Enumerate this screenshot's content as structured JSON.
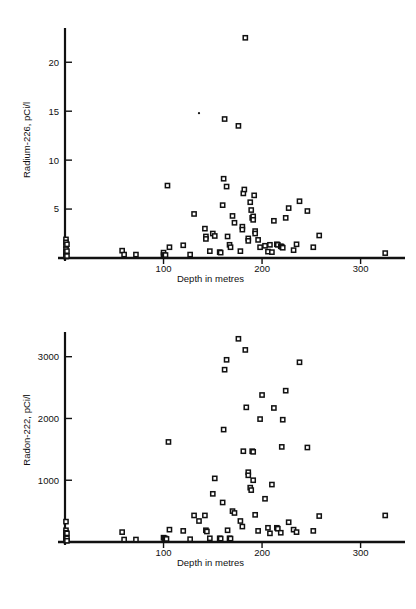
{
  "page": {
    "background_color": "#ffffff",
    "ink_color": "#111111",
    "marker_fill": "#ffffff"
  },
  "figures": [
    {
      "id": "radium-226-vs-depth",
      "ylabel": "Radium-226, pCi/l",
      "xlabel": "Depth in metres"
    },
    {
      "id": "radon-222-vs-depth",
      "ylabel": "Radon-222, pCi/l",
      "xlabel": "Depth in metres"
    }
  ],
  "chart_data": [
    {
      "type": "scatter",
      "title": "",
      "xlabel": "Depth in metres",
      "ylabel": "Radium-226, pCi/l",
      "xlim": [
        0,
        340
      ],
      "ylim": [
        0,
        23.5
      ],
      "xticks": [
        100,
        200,
        300
      ],
      "xticklabels": [
        "100",
        "200",
        "300"
      ],
      "yticks": [
        5,
        10,
        15,
        20
      ],
      "yticklabels": [
        "5",
        "10",
        "15",
        "20"
      ],
      "grid": false,
      "legend": null,
      "marker": "open-square",
      "points": [
        [
          1,
          1.9
        ],
        [
          1,
          1.6
        ],
        [
          1,
          1.3
        ],
        [
          1,
          0.9
        ],
        [
          1,
          0.6
        ],
        [
          1,
          0.3
        ],
        [
          1,
          0.15
        ],
        [
          2,
          1.4
        ],
        [
          2,
          0.7
        ],
        [
          2,
          0.2
        ],
        [
          58,
          0.75
        ],
        [
          60,
          0.35
        ],
        [
          72,
          0.35
        ],
        [
          100,
          0.55
        ],
        [
          100,
          0.3
        ],
        [
          101,
          0.25
        ],
        [
          102,
          0.3
        ],
        [
          104,
          7.4
        ],
        [
          106,
          1.1
        ],
        [
          120,
          1.3
        ],
        [
          127,
          0.35
        ],
        [
          131,
          4.5
        ],
        [
          136,
          14.8
        ],
        [
          142,
          3.0
        ],
        [
          143,
          2.2
        ],
        [
          143,
          1.95
        ],
        [
          147,
          0.7
        ],
        [
          150,
          2.5
        ],
        [
          152,
          2.25
        ],
        [
          157,
          0.6
        ],
        [
          158,
          0.55
        ],
        [
          160,
          5.4
        ],
        [
          161,
          8.1
        ],
        [
          162,
          14.2
        ],
        [
          164,
          7.3
        ],
        [
          165,
          2.2
        ],
        [
          167,
          1.35
        ],
        [
          168,
          1.1
        ],
        [
          170,
          4.3
        ],
        [
          172,
          3.6
        ],
        [
          176,
          13.5
        ],
        [
          178,
          0.7
        ],
        [
          180,
          3.2
        ],
        [
          180,
          2.9
        ],
        [
          181,
          6.6
        ],
        [
          182,
          7.0
        ],
        [
          183,
          22.5
        ],
        [
          186,
          2.0
        ],
        [
          186,
          1.75
        ],
        [
          188,
          5.7
        ],
        [
          189,
          4.9
        ],
        [
          190,
          4.1
        ],
        [
          191,
          4.25
        ],
        [
          191,
          3.9
        ],
        [
          192,
          6.4
        ],
        [
          193,
          2.75
        ],
        [
          193,
          2.5
        ],
        [
          196,
          1.85
        ],
        [
          198,
          1.1
        ],
        [
          203,
          1.25
        ],
        [
          206,
          0.65
        ],
        [
          208,
          1.35
        ],
        [
          210,
          0.6
        ],
        [
          212,
          3.8
        ],
        [
          215,
          1.4
        ],
        [
          216,
          1.35
        ],
        [
          219,
          1.2
        ],
        [
          220,
          1.15
        ],
        [
          221,
          1.05
        ],
        [
          224,
          4.1
        ],
        [
          227,
          5.1
        ],
        [
          232,
          0.8
        ],
        [
          235,
          1.4
        ],
        [
          238,
          5.8
        ],
        [
          246,
          4.8
        ],
        [
          252,
          1.1
        ],
        [
          258,
          2.3
        ],
        [
          325,
          0.5
        ]
      ]
    },
    {
      "type": "scatter",
      "title": "",
      "xlabel": "Depth in metres",
      "ylabel": "Radon-222, pCi/l",
      "xlim": [
        0,
        340
      ],
      "ylim": [
        0,
        3400
      ],
      "xticks": [
        100,
        200,
        300
      ],
      "xticklabels": [
        "100",
        "200",
        "300"
      ],
      "yticks": [
        1000,
        2000,
        3000
      ],
      "yticklabels": [
        "1000",
        "2000",
        "3000"
      ],
      "grid": false,
      "legend": null,
      "marker": "open-square",
      "points": [
        [
          1,
          330
        ],
        [
          1,
          190
        ],
        [
          1,
          150
        ],
        [
          1,
          110
        ],
        [
          1,
          80
        ],
        [
          1,
          50
        ],
        [
          1,
          25
        ],
        [
          2,
          140
        ],
        [
          2,
          60
        ],
        [
          2,
          20
        ],
        [
          58,
          160
        ],
        [
          60,
          40
        ],
        [
          72,
          40
        ],
        [
          100,
          70
        ],
        [
          101,
          60
        ],
        [
          102,
          55
        ],
        [
          103,
          50
        ],
        [
          105,
          1620
        ],
        [
          106,
          200
        ],
        [
          120,
          180
        ],
        [
          127,
          45
        ],
        [
          131,
          430
        ],
        [
          136,
          340
        ],
        [
          142,
          430
        ],
        [
          143,
          190
        ],
        [
          144,
          170
        ],
        [
          147,
          60
        ],
        [
          150,
          780
        ],
        [
          152,
          1030
        ],
        [
          157,
          60
        ],
        [
          158,
          55
        ],
        [
          160,
          640
        ],
        [
          161,
          1820
        ],
        [
          162,
          2790
        ],
        [
          164,
          2950
        ],
        [
          165,
          190
        ],
        [
          167,
          60
        ],
        [
          168,
          55
        ],
        [
          170,
          500
        ],
        [
          172,
          470
        ],
        [
          176,
          3290
        ],
        [
          178,
          340
        ],
        [
          180,
          250
        ],
        [
          181,
          1470
        ],
        [
          183,
          3110
        ],
        [
          184,
          2180
        ],
        [
          186,
          1130
        ],
        [
          186,
          1080
        ],
        [
          188,
          880
        ],
        [
          189,
          840
        ],
        [
          190,
          1470
        ],
        [
          191,
          1460
        ],
        [
          191,
          1000
        ],
        [
          193,
          440
        ],
        [
          196,
          180
        ],
        [
          198,
          1990
        ],
        [
          200,
          2380
        ],
        [
          203,
          700
        ],
        [
          206,
          230
        ],
        [
          208,
          140
        ],
        [
          210,
          930
        ],
        [
          212,
          2170
        ],
        [
          215,
          230
        ],
        [
          216,
          215
        ],
        [
          219,
          150
        ],
        [
          220,
          1540
        ],
        [
          221,
          1980
        ],
        [
          224,
          2450
        ],
        [
          227,
          320
        ],
        [
          232,
          200
        ],
        [
          235,
          160
        ],
        [
          238,
          2910
        ],
        [
          246,
          1530
        ],
        [
          252,
          180
        ],
        [
          258,
          420
        ],
        [
          325,
          430
        ]
      ]
    }
  ]
}
